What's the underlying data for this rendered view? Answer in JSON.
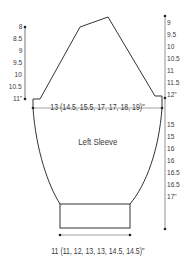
{
  "diagram": {
    "title": "Left Sleeve",
    "cap_width_label": "13 (14.5, 15.5, 17, 17, 18, 19)\"",
    "cuff_width_label": "11 (11, 12, 13, 13, 14.5, 14.5)\"",
    "cap_height_labels": [
      "8",
      "8.5",
      "9",
      "9.5",
      "10",
      "10.5",
      "11\""
    ],
    "total_height_labels_upper": [
      "9",
      "9.5",
      "10",
      "10.5",
      "11",
      "11.5",
      "12\""
    ],
    "total_height_labels_lower": [
      "15",
      "15",
      "16",
      "16",
      "16.5",
      "16.5",
      "17\""
    ],
    "line_color": "#333333",
    "text_color": "#3a3a3a"
  }
}
